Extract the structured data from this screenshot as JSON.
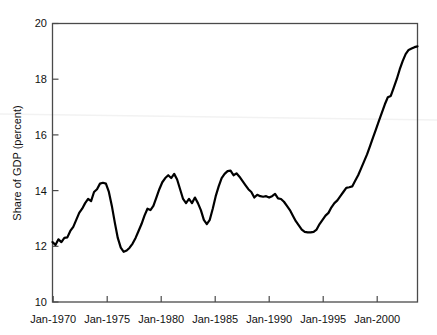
{
  "chart_data": {
    "type": "line",
    "title": "",
    "subtitle": "",
    "xlabel": "",
    "ylabel": "Share of GDP (percent)",
    "xlim": [
      "Jan-1970",
      "Jan-2000.8"
    ],
    "ylim": [
      10,
      20
    ],
    "grid": false,
    "legend": null,
    "annotations": [],
    "y_ticks": [
      "10",
      "12",
      "14",
      "16",
      "18",
      "20"
    ],
    "y_tick_values": [
      10,
      12,
      14,
      16,
      18,
      20
    ],
    "x_ticks": [
      "Jan-1970",
      "Jan-1975",
      "Jan-1980",
      "Jan-1985",
      "Jan-1990",
      "Jan-1995",
      "Jan-2000"
    ],
    "x_tick_values": [
      1970,
      1975,
      1980,
      1985,
      1990,
      1995,
      2000
    ],
    "series": [
      {
        "name": "Share of GDP",
        "color": "#000000",
        "x": [
          1970.0,
          1970.25,
          1970.5,
          1970.75,
          1971.0,
          1971.25,
          1971.5,
          1971.75,
          1972.0,
          1972.25,
          1972.5,
          1972.75,
          1973.0,
          1973.25,
          1973.5,
          1973.75,
          1974.0,
          1974.25,
          1974.5,
          1974.75,
          1975.0,
          1975.25,
          1975.5,
          1975.75,
          1976.0,
          1976.25,
          1976.5,
          1976.75,
          1977.0,
          1977.25,
          1977.5,
          1977.75,
          1978.0,
          1978.25,
          1978.5,
          1978.75,
          1979.0,
          1979.25,
          1979.5,
          1979.75,
          1980.0,
          1980.25,
          1980.5,
          1980.75,
          1981.0,
          1981.25,
          1981.5,
          1981.75,
          1982.0,
          1982.25,
          1982.5,
          1982.75,
          1983.0,
          1983.25,
          1983.5,
          1983.75,
          1984.0,
          1984.25,
          1984.5,
          1984.75,
          1985.0,
          1985.25,
          1985.5,
          1985.75,
          1986.0,
          1986.25,
          1986.5,
          1986.75,
          1987.0,
          1987.25,
          1987.5,
          1987.75,
          1988.0,
          1988.25,
          1988.5,
          1988.75,
          1989.0,
          1989.25,
          1989.5,
          1989.75,
          1990.0,
          1990.25,
          1990.5,
          1990.75,
          1991.0,
          1991.25,
          1991.5,
          1991.75,
          1992.0,
          1992.25,
          1992.5,
          1992.75,
          1993.0,
          1993.25,
          1993.5,
          1993.75,
          1994.0,
          1994.25,
          1994.5,
          1994.75,
          1995.0,
          1995.25,
          1995.5,
          1995.75,
          1996.0,
          1996.25,
          1996.5,
          1996.75,
          1997.0,
          1997.25,
          1997.5,
          1997.75,
          1998.0,
          1998.25,
          1998.5,
          1998.75,
          1999.0,
          1999.25,
          1999.5,
          1999.75,
          2000.0,
          2000.25,
          2000.5,
          2000.75
        ],
        "y": [
          12.15,
          12.05,
          12.25,
          12.15,
          12.3,
          12.32,
          12.55,
          12.7,
          12.95,
          13.2,
          13.35,
          13.55,
          13.7,
          13.62,
          13.95,
          14.05,
          14.25,
          14.28,
          14.25,
          13.95,
          13.45,
          12.85,
          12.3,
          11.95,
          11.8,
          11.85,
          11.95,
          12.1,
          12.3,
          12.55,
          12.8,
          13.1,
          13.35,
          13.3,
          13.45,
          13.75,
          14.05,
          14.3,
          14.45,
          14.55,
          14.45,
          14.6,
          14.4,
          14.05,
          13.7,
          13.55,
          13.7,
          13.55,
          13.75,
          13.55,
          13.3,
          12.95,
          12.8,
          12.95,
          13.35,
          13.8,
          14.15,
          14.45,
          14.6,
          14.7,
          14.72,
          14.55,
          14.62,
          14.5,
          14.35,
          14.2,
          14.05,
          13.95,
          13.75,
          13.85,
          13.8,
          13.78,
          13.8,
          13.75,
          13.8,
          13.88,
          13.72,
          13.7,
          13.6,
          13.45,
          13.3,
          13.1,
          12.9,
          12.75,
          12.6,
          12.52,
          12.5,
          12.5,
          12.52,
          12.6,
          12.8,
          12.95,
          13.1,
          13.2,
          13.4,
          13.55,
          13.65,
          13.8,
          13.95,
          14.1,
          14.12,
          14.15,
          14.35,
          14.55,
          14.8,
          15.05,
          15.3,
          15.6,
          15.9,
          16.2,
          16.5,
          16.8,
          17.1,
          17.35,
          17.4,
          17.7,
          18.0,
          18.35,
          18.65,
          18.9,
          19.05,
          19.1,
          19.15,
          19.18
        ]
      }
    ],
    "notes": {
      "line_width": 2.2,
      "frame": "box",
      "tick_direction": "in"
    }
  },
  "figure": {
    "background_color": "#ffffff",
    "axis_color": "#444444",
    "line_color": "#000000",
    "artifact_line_color": "#f2f2f2"
  }
}
